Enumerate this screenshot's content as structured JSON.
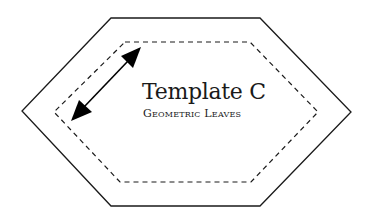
{
  "template": {
    "title": "Template C",
    "subtitle": "Geometric Leaves"
  },
  "shapes": {
    "outer_hexagon": {
      "points": "111,18 260,18 351,112 260,206 111,206 22,111",
      "stroke": "#1a1a1a",
      "style": "solid"
    },
    "inner_hexagon": {
      "points": "125,42 250,42 318,112 251,182 120,182 54,112",
      "stroke": "#1a1a1a",
      "style": "dashed"
    },
    "measurement_arrow": {
      "from": [
        141,
        47
      ],
      "to": [
        71,
        121
      ],
      "color": "#000000",
      "meaning": "seam allowance"
    }
  },
  "colors": {
    "background": "#ffffff",
    "ink": "#1a1a1a"
  }
}
